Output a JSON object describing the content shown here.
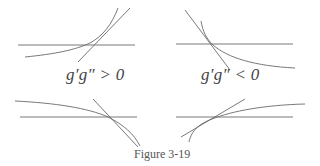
{
  "figure": {
    "caption": "Figure 3-19",
    "labels": {
      "positive": "g′g″ > 0",
      "negative": "g′g″ < 0"
    },
    "stroke_color": "#6a6a6a",
    "panels": [
      {
        "id": "top-left",
        "condition": "g'g'' > 0",
        "description": "Increasing convex curve crossing horizontal axis with its tangent line"
      },
      {
        "id": "top-right",
        "condition": "g'g'' < 0",
        "description": "Decreasing convex curve crossing horizontal axis with its tangent line"
      },
      {
        "id": "bottom-left",
        "condition": "g'g'' > 0",
        "description": "Decreasing concave curve crossing horizontal axis with its tangent line"
      },
      {
        "id": "bottom-right",
        "condition": "g'g'' < 0",
        "description": "Increasing concave curve crossing horizontal axis with its tangent line"
      }
    ]
  }
}
